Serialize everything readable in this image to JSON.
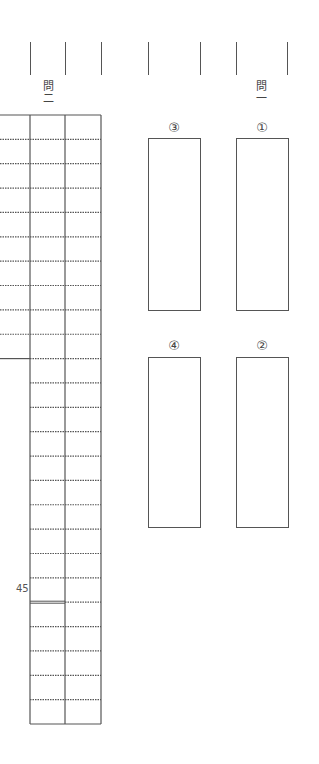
{
  "sheet": {
    "section_two": {
      "label_top": "問",
      "label_num": "二",
      "grid_rows": 25,
      "left_column_rows": 10,
      "character_marker": "45",
      "character_marker_row": 20
    },
    "section_one": {
      "label_top": "問",
      "label_num": "一",
      "answer_boxes": [
        {
          "label": "③"
        },
        {
          "label": "①"
        },
        {
          "label": "④"
        },
        {
          "label": "②"
        }
      ]
    },
    "colors": {
      "line": "#555555",
      "text": "#444444"
    }
  }
}
